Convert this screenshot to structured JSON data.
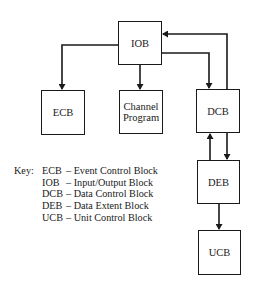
{
  "diagram": {
    "type": "block-diagram",
    "nodes": [
      {
        "id": "iob",
        "label": "IOB"
      },
      {
        "id": "ecb",
        "label": "ECB"
      },
      {
        "id": "channel",
        "label": "Channel Program",
        "line1": "Channel",
        "line2": "Program"
      },
      {
        "id": "dcb",
        "label": "DCB"
      },
      {
        "id": "deb",
        "label": "DEB"
      },
      {
        "id": "ucb",
        "label": "UCB"
      }
    ],
    "edges": [
      {
        "from": "IOB",
        "to": "ECB"
      },
      {
        "from": "IOB",
        "to": "Channel Program"
      },
      {
        "from": "IOB",
        "to": "DCB"
      },
      {
        "from": "DCB",
        "to": "IOB"
      },
      {
        "from": "DCB",
        "to": "DEB"
      },
      {
        "from": "DEB",
        "to": "DCB"
      },
      {
        "from": "DEB",
        "to": "UCB"
      }
    ]
  },
  "key": {
    "label": "Key:",
    "entries": [
      {
        "abbr": "ECB",
        "text": "– Event Control Block"
      },
      {
        "abbr": "IOB",
        "text": "– Input/Output Block"
      },
      {
        "abbr": "DCB",
        "text": "– Data Control Block"
      },
      {
        "abbr": "DEB",
        "text": "– Data Extent Block"
      },
      {
        "abbr": "UCB",
        "text": "– Unit Control Block"
      }
    ]
  },
  "colors": {
    "line": "#1a1a1a",
    "background": "#ffffff"
  }
}
